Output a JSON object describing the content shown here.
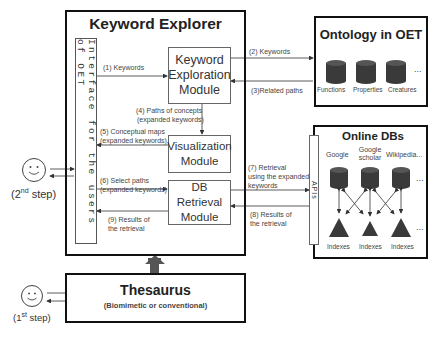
{
  "keyword_explorer": {
    "title": "Keyword Explorer",
    "interface_label": "Interface for the users of OET",
    "modules": {
      "keyword_exploration": "Keyword Exploration Module",
      "visualization": "Visualization Module",
      "db_retrieval": "DB Retrieval Module"
    }
  },
  "ontology": {
    "title": "Ontology in OET",
    "databases": [
      "Functions",
      "Properties",
      "Creatures"
    ],
    "more": "..."
  },
  "online_dbs": {
    "title": "Online DBs",
    "apis_label": "APIs",
    "sources": [
      "Google",
      "Google scholar",
      "Wikipedia..."
    ],
    "indexes": [
      "Indexes",
      "Indexes",
      "Indexes"
    ],
    "more": "..."
  },
  "thesaurus": {
    "title": "Thesaurus",
    "subtitle": "(Biomimetic or conventional)"
  },
  "steps": {
    "second": {
      "prefix": "(2",
      "sup": "nd",
      "suffix": " step)"
    },
    "first": {
      "prefix": "(1",
      "sup": "st",
      "suffix": " step)"
    }
  },
  "flows": {
    "f1": "(1) Keywords",
    "f2": "(2) Keywords",
    "f3": "(3)Related paths",
    "f4a": "(4) Paths of concepts",
    "f4b": "(expanded keywords)",
    "f5a": "(5) Conceptual maps",
    "f5b": "(expanded keywords)",
    "f6a": "(6) Select paths",
    "f6b": "(expanded keywords)",
    "f7a": "(7) Retrieval",
    "f7b": "using the expanded",
    "f7c": "keywords",
    "f8a": "(8) Results of",
    "f8b": "the retrieval",
    "f9a": "(9) Results of",
    "f9b": "the retrieval"
  },
  "colors": {
    "db_fill": "#3a3a3a",
    "border": "#111111",
    "arrow": "#333333",
    "big_arrow": "#555555"
  }
}
